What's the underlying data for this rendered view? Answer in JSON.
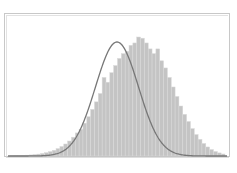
{
  "chart_data": {
    "type": "bar",
    "subtype": "histogram-with-normal-fit",
    "title": "",
    "xlabel": "",
    "ylabel": "",
    "grid": false,
    "legend": null,
    "x_pixel_range": [
      10,
      225
    ],
    "baseline_y": 156,
    "peak_y": 37,
    "bins": 56,
    "values": [
      0.2,
      0.3,
      0.4,
      0.5,
      0.7,
      0.9,
      1.2,
      1.6,
      2.1,
      2.8,
      3.7,
      4.8,
      6.2,
      8,
      10.1,
      12.6,
      15.8,
      19.4,
      22.5,
      27.6,
      33,
      39.2,
      45.5,
      52.5,
      66,
      62,
      70,
      76,
      82,
      86,
      88,
      93,
      95,
      100,
      99,
      95,
      90,
      86,
      90,
      80,
      74,
      66,
      58,
      50,
      42,
      35,
      29,
      23,
      18,
      14,
      10.5,
      7.6,
      5.4,
      3.8,
      2.6,
      1.7
    ],
    "fit_curve": {
      "type": "normal",
      "mean_px": 117,
      "sigma_px": 21.5,
      "peak_y_px": 42,
      "baseline_y_px": 156,
      "color": "#777777"
    },
    "bar_color": "#c4c4c4",
    "bar_edge_color": "#dadada"
  }
}
